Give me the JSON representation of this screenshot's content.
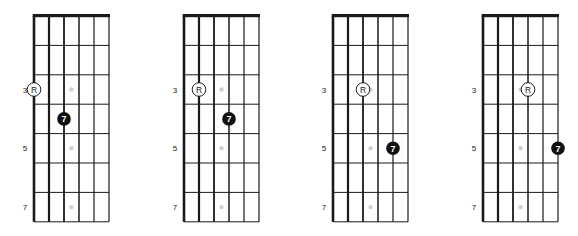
{
  "figure": {
    "title": "",
    "string_count": 6,
    "frets_shown": 7,
    "fret_labels": [
      {
        "fret": 3,
        "label": "3"
      },
      {
        "fret": 5,
        "label": "5"
      },
      {
        "fret": 7,
        "label": "7"
      }
    ],
    "inlay_frets": [
      3,
      5,
      7
    ],
    "colors": {
      "line": "#1a1a1a",
      "nut": "#1a1a1a",
      "inlay": "#d0d0d0",
      "root_fill": "#ffffff",
      "root_stroke": "#1a1a1a",
      "seventh_fill": "#111111",
      "seventh_text": "#ffffff",
      "label": "#1a1a1a"
    }
  },
  "diagrams": [
    {
      "id": "diagram-1",
      "x": 34,
      "notes": [
        {
          "role": "root",
          "label": "R",
          "string": 1,
          "fret": 3
        },
        {
          "role": "seventh",
          "label": "7",
          "string": 3,
          "fret": 4
        }
      ]
    },
    {
      "id": "diagram-2",
      "x": 184,
      "notes": [
        {
          "role": "root",
          "label": "R",
          "string": 2,
          "fret": 3
        },
        {
          "role": "seventh",
          "label": "7",
          "string": 4,
          "fret": 4
        }
      ]
    },
    {
      "id": "diagram-3",
      "x": 333,
      "notes": [
        {
          "role": "root",
          "label": "R",
          "string": 3,
          "fret": 3
        },
        {
          "role": "seventh",
          "label": "7",
          "string": 5,
          "fret": 5
        }
      ]
    },
    {
      "id": "diagram-4",
      "x": 483,
      "notes": [
        {
          "role": "root",
          "label": "R",
          "string": 4,
          "fret": 3
        },
        {
          "role": "seventh",
          "label": "7",
          "string": 6,
          "fret": 5
        }
      ]
    }
  ]
}
